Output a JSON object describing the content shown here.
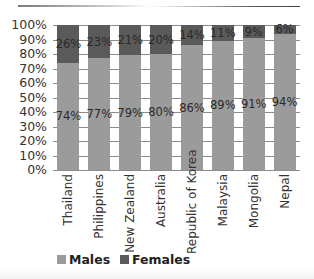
{
  "chart_data": {
    "type": "bar",
    "stacked": true,
    "percent": true,
    "title": "",
    "xlabel": "",
    "ylabel": "",
    "ylim": [
      0,
      100
    ],
    "yticks": [
      "0%",
      "10%",
      "20%",
      "30%",
      "40%",
      "50%",
      "60%",
      "70%",
      "80%",
      "90%",
      "100%"
    ],
    "categories": [
      "Thailand",
      "Philippines",
      "New Zealand",
      "Australia",
      "Republic of Korea",
      "Malaysia",
      "Mongolia",
      "Nepal"
    ],
    "series": [
      {
        "name": "Males",
        "color": "#9b9b9b",
        "values": [
          74,
          77,
          79,
          80,
          86,
          89,
          91,
          94
        ],
        "labels": [
          "74%",
          "77%",
          "79%",
          "80%",
          "86%",
          "89%",
          "91%",
          "94%"
        ]
      },
      {
        "name": "Females",
        "color": "#5a5a5a",
        "values": [
          26,
          23,
          21,
          20,
          14,
          11,
          9,
          6
        ],
        "labels": [
          "26%",
          "23%",
          "21%",
          "20%",
          "14%",
          "11%",
          "9%",
          "6%"
        ]
      }
    ],
    "grid": true,
    "legend_position": "bottom-left"
  }
}
